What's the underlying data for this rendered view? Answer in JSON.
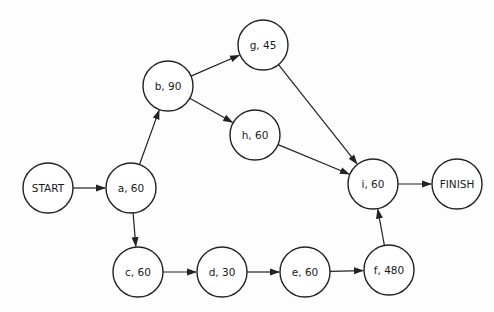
{
  "diagram": {
    "type": "activity-network",
    "node_radius": 25,
    "colors": {
      "stroke": "#222222",
      "fill": "#ffffff",
      "text": "#1a1a1a",
      "background": "#fdfdfd"
    },
    "nodes": [
      {
        "id": "start",
        "label": "START",
        "x": 48,
        "y": 188
      },
      {
        "id": "a",
        "label": "a, 60",
        "x": 131,
        "y": 188
      },
      {
        "id": "b",
        "label": "b, 90",
        "x": 168,
        "y": 86
      },
      {
        "id": "g",
        "label": "g, 45",
        "x": 263,
        "y": 45
      },
      {
        "id": "h",
        "label": "h, 60",
        "x": 255,
        "y": 135
      },
      {
        "id": "i",
        "label": "i, 60",
        "x": 373,
        "y": 184
      },
      {
        "id": "finish",
        "label": "FINISH",
        "x": 457,
        "y": 184
      },
      {
        "id": "c",
        "label": "c, 60",
        "x": 138,
        "y": 272
      },
      {
        "id": "d",
        "label": "d, 30",
        "x": 222,
        "y": 272
      },
      {
        "id": "e",
        "label": "e, 60",
        "x": 305,
        "y": 272
      },
      {
        "id": "f",
        "label": "f, 480",
        "x": 389,
        "y": 270
      }
    ],
    "edges": [
      {
        "from": "start",
        "to": "a"
      },
      {
        "from": "a",
        "to": "b"
      },
      {
        "from": "a",
        "to": "c"
      },
      {
        "from": "b",
        "to": "g"
      },
      {
        "from": "b",
        "to": "h"
      },
      {
        "from": "g",
        "to": "i"
      },
      {
        "from": "h",
        "to": "i"
      },
      {
        "from": "c",
        "to": "d"
      },
      {
        "from": "d",
        "to": "e"
      },
      {
        "from": "e",
        "to": "f"
      },
      {
        "from": "f",
        "to": "i"
      },
      {
        "from": "i",
        "to": "finish"
      }
    ]
  }
}
